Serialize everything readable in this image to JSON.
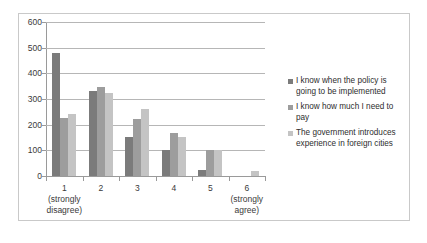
{
  "chart_data": {
    "type": "bar",
    "title": "",
    "subtitle": "",
    "xlabel": "",
    "ylabel": "",
    "categories": [
      "1",
      "2",
      "3",
      "4",
      "5",
      "6"
    ],
    "category_sublabels": [
      "(strongly disagree)",
      "",
      "",
      "",
      "",
      "(strongly agree)"
    ],
    "series": [
      {
        "name": "I know when the policy is going to be implemented",
        "color": "#7b7b7b",
        "values": [
          480,
          330,
          152,
          100,
          22,
          0
        ]
      },
      {
        "name": "I know how much I need to pay",
        "color": "#9d9d9d",
        "values": [
          225,
          348,
          222,
          168,
          100,
          0
        ]
      },
      {
        "name": "The government introduces experience in foreign cities",
        "color": "#c4c4c4",
        "values": [
          242,
          325,
          260,
          152,
          100,
          20
        ]
      }
    ],
    "ylim": [
      0,
      600
    ],
    "ytick_step": 100,
    "yticks": [
      "600",
      "500",
      "400",
      "300",
      "200",
      "100",
      "0"
    ],
    "grid": true,
    "grid_axis": "y",
    "legend_position": "right",
    "legend": [
      "I know when the policy is going to be implemented",
      "I know how much I need to pay",
      "The government introduces experience in foreign cities"
    ],
    "colors": {
      "series_1": "#7b7b7b",
      "series_2": "#9d9d9d",
      "series_3": "#c4c4c4",
      "gridline": "#b6b6b6",
      "axis": "#9a9a9a",
      "frame": "#c9c9c9",
      "background": "#ffffff",
      "text": "#3a3a3a"
    }
  }
}
